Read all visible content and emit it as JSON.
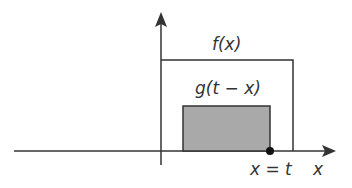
{
  "diagram": {
    "type": "convolution-illustration",
    "labels": {
      "f": "f(x)",
      "g": "g(t − x)",
      "point": "x = t",
      "x_axis": "x"
    },
    "colors": {
      "line": "#333333",
      "shaded_fill": "#a9a9a9",
      "background": "#ffffff"
    },
    "geometry": {
      "x_axis_y": 151,
      "y_axis_x": 161,
      "f_rect": {
        "left": 161,
        "top": 60,
        "right": 293,
        "bottom": 151
      },
      "g_rect": {
        "left": 183,
        "top": 106,
        "right": 270,
        "bottom": 151
      },
      "dot": {
        "x": 270,
        "y": 151
      }
    }
  }
}
